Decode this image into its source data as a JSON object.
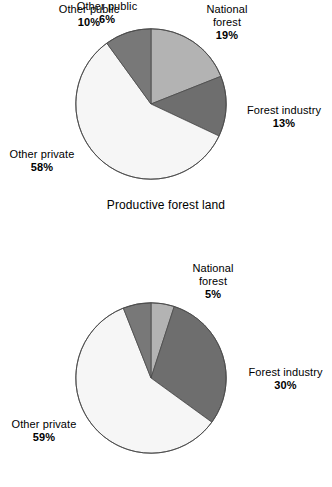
{
  "colors": {
    "national_forest": "#b3b3b3",
    "forest_industry": "#6e6e6e",
    "other_public": "#787878",
    "other_private": "#f6f6f6",
    "outline": "#4a4a4a",
    "text": "#000000",
    "background": "#ffffff"
  },
  "chart_data": [
    {
      "type": "pie",
      "title": "Productive forest land",
      "id": "productive-forest-land",
      "legend": "labels-around-slices",
      "start_angle_deg": 0,
      "direction": "clockwise",
      "categories": [
        "National forest",
        "Forest industry",
        "Other private",
        "Other public"
      ],
      "values": [
        19,
        13,
        58,
        10
      ],
      "units": "percent",
      "slices": [
        {
          "label": "National forest",
          "value": 19,
          "value_text": "19%",
          "color": "#b3b3b3"
        },
        {
          "label": "Forest industry",
          "value": 13,
          "value_text": "13%",
          "color": "#6e6e6e"
        },
        {
          "label": "Other private",
          "value": 58,
          "value_text": "58%",
          "color": "#f6f6f6"
        },
        {
          "label": "Other public",
          "value": 10,
          "value_text": "10%",
          "color": "#787878"
        }
      ]
    },
    {
      "type": "pie",
      "title": "",
      "id": "second-pie",
      "legend": "labels-around-slices",
      "start_angle_deg": 0,
      "direction": "clockwise",
      "categories": [
        "National forest",
        "Forest industry",
        "Other private",
        "Other public"
      ],
      "values": [
        5,
        30,
        59,
        6
      ],
      "units": "percent",
      "slices": [
        {
          "label": "National forest",
          "value": 5,
          "value_text": "5%",
          "color": "#b3b3b3"
        },
        {
          "label": "Forest industry",
          "value": 30,
          "value_text": "30%",
          "color": "#6e6e6e"
        },
        {
          "label": "Other private",
          "value": 59,
          "value_text": "59%",
          "color": "#f6f6f6"
        },
        {
          "label": "Other public",
          "value": 6,
          "value_text": "6%",
          "color": "#787878"
        }
      ]
    }
  ],
  "top_chart": {
    "caption": "Productive forest land",
    "labels": {
      "national_forest": {
        "name": "National\nforest",
        "name_line1": "National",
        "name_line2": "forest",
        "pct": "19%"
      },
      "forest_industry": {
        "name": "Forest industry",
        "pct": "13%"
      },
      "other_private": {
        "name": "Other private",
        "pct": "58%"
      },
      "other_public": {
        "name": "Other public",
        "pct": "10%"
      }
    }
  },
  "bottom_chart": {
    "caption": "",
    "labels": {
      "national_forest": {
        "name_line1": "National",
        "name_line2": "forest",
        "pct": "5%"
      },
      "forest_industry": {
        "name": "Forest industry",
        "pct": "30%"
      },
      "other_private": {
        "name": "Other private",
        "pct": "59%"
      },
      "other_public": {
        "name": "Other public",
        "pct": "6%"
      }
    }
  }
}
